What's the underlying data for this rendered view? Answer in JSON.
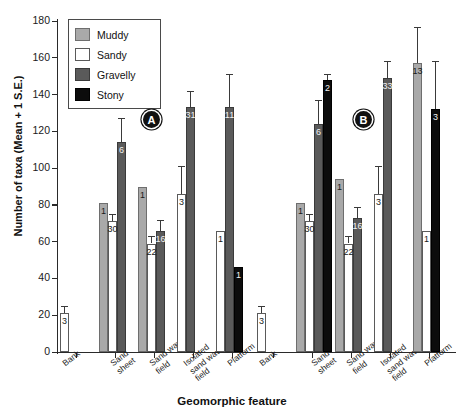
{
  "chart_data": {
    "type": "bar",
    "title": "",
    "xlabel": "Geomorphic feature",
    "ylabel": "Number of taxa (Mean + 1 S.E.)",
    "ylim": [
      0,
      180
    ],
    "yticks": [
      0,
      20,
      40,
      60,
      80,
      100,
      120,
      140,
      160,
      180
    ],
    "grid": false,
    "legend_position": "top-left",
    "categories": [
      "Bank",
      "Sand sheet",
      "Sand wave field",
      "Isolated sand wave field",
      "Platform"
    ],
    "panels": [
      {
        "marker": "A",
        "series": [
          {
            "name": "Muddy",
            "color": "#a9a9a9",
            "values": [
              null,
              81,
              90,
              null,
              null
            ],
            "errors": [
              null,
              0,
              0,
              null,
              null
            ],
            "labels": [
              null,
              "1",
              "1",
              null,
              null
            ]
          },
          {
            "name": "Sandy",
            "color": "#ffffff",
            "values": [
              21,
              71,
              59,
              86,
              66
            ],
            "errors": [
              4,
              4,
              4,
              15,
              0
            ],
            "labels": [
              "3",
              "30",
              "22",
              "3",
              "1"
            ]
          },
          {
            "name": "Gravelly",
            "color": "#5a5a5a",
            "values": [
              null,
              114,
              66,
              133,
              133
            ],
            "errors": [
              null,
              13,
              6,
              9,
              18
            ],
            "labels": [
              null,
              "6",
              "16",
              "31",
              "11"
            ]
          },
          {
            "name": "Stony",
            "color": "#0c0c0c",
            "values": [
              null,
              null,
              null,
              null,
              46
            ],
            "errors": [
              null,
              null,
              null,
              null,
              0
            ],
            "labels": [
              null,
              null,
              null,
              null,
              "1"
            ]
          }
        ]
      },
      {
        "marker": "B",
        "series": [
          {
            "name": "Muddy",
            "color": "#a9a9a9",
            "values": [
              null,
              81,
              94,
              null,
              157
            ],
            "errors": [
              null,
              0,
              0,
              null,
              20
            ],
            "labels": [
              null,
              "1",
              "1",
              null,
              "13"
            ]
          },
          {
            "name": "Sandy",
            "color": "#ffffff",
            "values": [
              21,
              71,
              59,
              86,
              66
            ],
            "errors": [
              4,
              4,
              4,
              15,
              0
            ],
            "labels": [
              "3",
              "30",
              "22",
              "3",
              "1"
            ]
          },
          {
            "name": "Gravelly",
            "color": "#5a5a5a",
            "values": [
              null,
              124,
              73,
              149,
              null
            ],
            "errors": [
              null,
              13,
              6,
              9,
              null
            ],
            "labels": [
              null,
              "6",
              "16",
              "33",
              null
            ]
          },
          {
            "name": "Stony",
            "color": "#0c0c0c",
            "values": [
              null,
              148,
              null,
              null,
              132
            ],
            "errors": [
              null,
              3,
              null,
              null,
              26
            ],
            "labels": [
              null,
              "2",
              null,
              null,
              "3"
            ]
          }
        ]
      }
    ]
  },
  "legend": {
    "items": [
      {
        "label": "Muddy",
        "swatch": "muddy"
      },
      {
        "label": "Sandy",
        "swatch": "sandy"
      },
      {
        "label": "Gravelly",
        "swatch": "gravelly"
      },
      {
        "label": "Stony",
        "swatch": "stony"
      }
    ]
  },
  "axis": {
    "y_title": "Number of taxa (Mean + 1 S.E.)",
    "x_title": "Geomorphic feature",
    "y_tick_labels": [
      "0",
      "20",
      "40",
      "60",
      "80",
      "100",
      "120",
      "140",
      "160",
      "180"
    ],
    "x_tick_labels": [
      "Bank",
      "Sand\nsheet",
      "Sand wave\nfield",
      "Isolated\nsand wave\nfield",
      "Platform",
      "Bank",
      "Sand\nsheet",
      "Sand wave\nfield",
      "Isolated\nsand wave\nfield",
      "Platform"
    ]
  },
  "panel_markers": [
    "A",
    "B"
  ]
}
